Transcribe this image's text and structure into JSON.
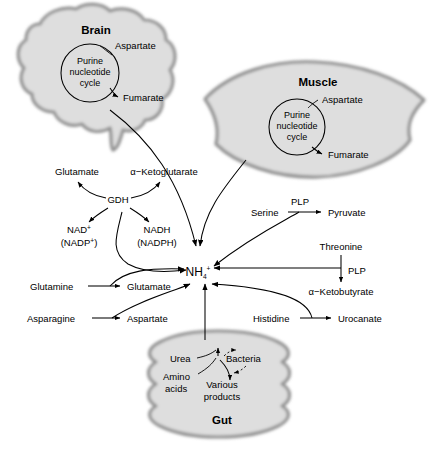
{
  "diagram": {
    "center_node": {
      "label": "NH",
      "sub": "4",
      "sup": "+"
    },
    "organs": [
      {
        "id": "brain",
        "label": "Brain",
        "cycle": [
          "Purine",
          "nucleotide",
          "cycle"
        ],
        "inputs": [
          "Aspartate"
        ],
        "outputs": [
          "Fumarate"
        ]
      },
      {
        "id": "muscle",
        "label": "Muscle",
        "cycle": [
          "Purine",
          "nucleotide",
          "cycle"
        ],
        "inputs": [
          "Aspartate"
        ],
        "outputs": [
          "Fumarate"
        ]
      },
      {
        "id": "gut",
        "label": "Gut",
        "nodes": [
          "Urea",
          "Amino",
          "acids",
          "Bacteria",
          "Various",
          "products"
        ]
      }
    ],
    "gdh_reaction": {
      "enzyme": "GDH",
      "substrate": "Glutamate",
      "product": "α−Ketoglutarate",
      "cofactor_in": "NAD⁺",
      "cofactor_in_alt": "(NADP⁺)",
      "cofactor_out": "NADH",
      "cofactor_out_alt": "(NADPH)"
    },
    "reactions": [
      {
        "substrate": "Glutamine",
        "product": "Glutamate",
        "cofactor": ""
      },
      {
        "substrate": "Asparagine",
        "product": "Aspartate",
        "cofactor": ""
      },
      {
        "substrate": "Serine",
        "product": "Pyruvate",
        "cofactor": "PLP"
      },
      {
        "substrate": "Threonine",
        "product": "α−Ketobutyrate",
        "cofactor": "PLP"
      },
      {
        "substrate": "Histidine",
        "product": "Urocanate",
        "cofactor": ""
      }
    ],
    "labels": {
      "brain": "Brain",
      "muscle": "Muscle",
      "gut": "Gut",
      "purine": "Purine",
      "nucleotide": "nucleotide",
      "cycle": "cycle",
      "aspartate": "Aspartate",
      "fumarate": "Fumarate",
      "glutamate": "Glutamate",
      "ketoglutarate": "α−Ketoglutarate",
      "gdh": "GDH",
      "nad": "NAD",
      "nadp": "(NADP",
      "nadh": "NADH",
      "nadph": "(NADPH)",
      "glutamine": "Glutamine",
      "glutamate2": "Glutamate",
      "asparagine": "Asparagine",
      "aspartate2": "Aspartate",
      "serine": "Serine",
      "plp1": "PLP",
      "pyruvate": "Pyruvate",
      "threonine": "Threonine",
      "plp2": "PLP",
      "ketobutyrate": "α−Ketobutyrate",
      "histidine": "Histidine",
      "urocanate": "Urocanate",
      "urea": "Urea",
      "bacteria": "Bacteria",
      "amino": "Amino",
      "acids": "acids",
      "various": "Various",
      "products": "products",
      "nh4_base": "NH",
      "nh4_sub": "4",
      "nh4_sup": "+",
      "plus": "+"
    },
    "colors": {
      "organ_fill": "#dedede",
      "organ_stroke": "#8e8e8e",
      "line": "#000000",
      "background": "#ffffff"
    }
  }
}
